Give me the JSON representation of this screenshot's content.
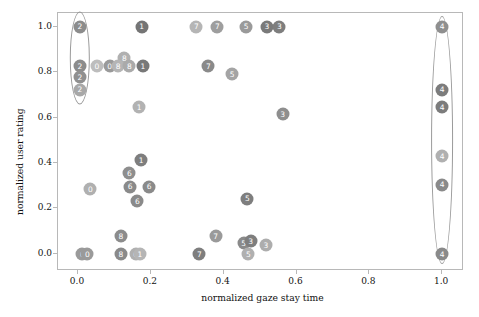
{
  "chart_data": {
    "type": "scatter",
    "title": "",
    "xlabel": "normalized gaze stay time",
    "ylabel": "normalized user rating",
    "xlim": [
      -0.055,
      1.06
    ],
    "ylim": [
      -0.075,
      1.06
    ],
    "xticks": [
      "0.0",
      "0.2",
      "0.4",
      "0.6",
      "0.8",
      "1.0"
    ],
    "xtick_values": [
      0.0,
      0.2,
      0.4,
      0.6,
      0.8,
      1.0
    ],
    "yticks": [
      "0.0",
      "0.2",
      "0.4",
      "0.6",
      "0.8",
      "1.0"
    ],
    "ytick_values": [
      0.0,
      0.2,
      0.4,
      0.6,
      0.8,
      1.0
    ],
    "grid": false,
    "legend": "none",
    "marker_style": "filled-circle-with-numeric-label",
    "points": [
      {
        "label": "2",
        "x": 0.005,
        "y": 1.0,
        "color": "#8c8c8c"
      },
      {
        "label": "1",
        "x": 0.175,
        "y": 1.0,
        "color": "#757575"
      },
      {
        "label": "7",
        "x": 0.325,
        "y": 1.0,
        "color": "#b5b5b5"
      },
      {
        "label": "7",
        "x": 0.383,
        "y": 1.0,
        "color": "#9e9e9e"
      },
      {
        "label": "5",
        "x": 0.462,
        "y": 1.0,
        "color": "#9a9a9a"
      },
      {
        "label": "3",
        "x": 0.519,
        "y": 1.0,
        "color": "#7a7a7a"
      },
      {
        "label": "3",
        "x": 0.553,
        "y": 1.0,
        "color": "#7e7e7e"
      },
      {
        "label": "4",
        "x": 1.0,
        "y": 1.0,
        "color": "#8f8f8f"
      },
      {
        "label": "8",
        "x": 0.127,
        "y": 0.862,
        "color": "#b0b0b0"
      },
      {
        "label": "2",
        "x": 0.005,
        "y": 0.825,
        "color": "#8c8c8c"
      },
      {
        "label": "0",
        "x": 0.052,
        "y": 0.825,
        "color": "#bdbdbd"
      },
      {
        "label": "0",
        "x": 0.087,
        "y": 0.825,
        "color": "#9a9a9a"
      },
      {
        "label": "8",
        "x": 0.11,
        "y": 0.825,
        "color": "#b5b5b5"
      },
      {
        "label": "8",
        "x": 0.141,
        "y": 0.825,
        "color": "#aaaaaa"
      },
      {
        "label": "1",
        "x": 0.178,
        "y": 0.825,
        "color": "#787878"
      },
      {
        "label": "7",
        "x": 0.358,
        "y": 0.825,
        "color": "#8a8a8a"
      },
      {
        "label": "2",
        "x": 0.005,
        "y": 0.777,
        "color": "#909090"
      },
      {
        "label": "5",
        "x": 0.423,
        "y": 0.79,
        "color": "#a4a4a4"
      },
      {
        "label": "2",
        "x": 0.005,
        "y": 0.723,
        "color": "#a8a8a8"
      },
      {
        "label": "4",
        "x": 1.0,
        "y": 0.723,
        "color": "#7c7c7c"
      },
      {
        "label": "1",
        "x": 0.168,
        "y": 0.645,
        "color": "#b2b2b2"
      },
      {
        "label": "4",
        "x": 1.0,
        "y": 0.645,
        "color": "#7c7c7c"
      },
      {
        "label": "3",
        "x": 0.562,
        "y": 0.615,
        "color": "#8e8e8e"
      },
      {
        "label": "4",
        "x": 1.0,
        "y": 0.432,
        "color": "#b0b0b0"
      },
      {
        "label": "1",
        "x": 0.173,
        "y": 0.412,
        "color": "#7e7e7e"
      },
      {
        "label": "6",
        "x": 0.141,
        "y": 0.355,
        "color": "#8e8e8e"
      },
      {
        "label": "4",
        "x": 1.0,
        "y": 0.305,
        "color": "#8a8a8a"
      },
      {
        "label": "6",
        "x": 0.143,
        "y": 0.296,
        "color": "#8a8a8a"
      },
      {
        "label": "6",
        "x": 0.195,
        "y": 0.296,
        "color": "#8a8a8a"
      },
      {
        "label": "0",
        "x": 0.034,
        "y": 0.285,
        "color": "#b0b0b0"
      },
      {
        "label": "6",
        "x": 0.163,
        "y": 0.233,
        "color": "#8a8a8a"
      },
      {
        "label": "5",
        "x": 0.465,
        "y": 0.243,
        "color": "#7e7e7e"
      },
      {
        "label": "8",
        "x": 0.118,
        "y": 0.08,
        "color": "#8c8c8c"
      },
      {
        "label": "7",
        "x": 0.378,
        "y": 0.08,
        "color": "#9a9a9a"
      },
      {
        "label": "5",
        "x": 0.455,
        "y": 0.048,
        "color": "#8a8a8a"
      },
      {
        "label": "3",
        "x": 0.474,
        "y": 0.055,
        "color": "#7e7e7e"
      },
      {
        "label": "3",
        "x": 0.516,
        "y": 0.04,
        "color": "#adadad"
      },
      {
        "label": "0",
        "x": 0.012,
        "y": 0.0,
        "color": "#9a9a9a"
      },
      {
        "label": "0",
        "x": 0.026,
        "y": 0.0,
        "color": "#9a9a9a"
      },
      {
        "label": "8",
        "x": 0.118,
        "y": 0.0,
        "color": "#8a8a8a"
      },
      {
        "label": "6",
        "x": 0.158,
        "y": 0.0,
        "color": "#b0b0b0"
      },
      {
        "label": "1",
        "x": 0.17,
        "y": 0.0,
        "color": "#b5b5b5"
      },
      {
        "label": "7",
        "x": 0.333,
        "y": 0.0,
        "color": "#7e7e7e"
      },
      {
        "label": "5",
        "x": 0.468,
        "y": 0.0,
        "color": "#b0b0b0"
      },
      {
        "label": "4",
        "x": 1.0,
        "y": 0.0,
        "color": "#8a8a8a"
      }
    ],
    "annotations": [
      {
        "type": "ellipse",
        "name": "left-cluster-ellipse",
        "cx": 0.005,
        "cy": 0.862,
        "rx": 0.028,
        "ry": 0.205,
        "color": "#9a9a9a"
      },
      {
        "type": "ellipse",
        "name": "right-cluster-ellipse",
        "cx": 1.0,
        "cy": 0.5,
        "rx": 0.03,
        "ry": 0.545,
        "color": "#9a9a9a"
      }
    ]
  }
}
